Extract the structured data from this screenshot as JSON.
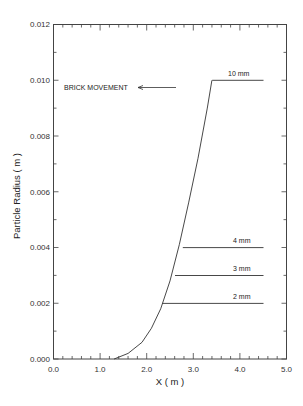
{
  "chart_data": {
    "type": "line",
    "title": "",
    "xlabel": "X ( m )",
    "ylabel": "Particle Radius ( m )",
    "xlim": [
      0.0,
      5.0
    ],
    "ylim": [
      0.0,
      0.012
    ],
    "xticks": [
      "0.0",
      "1.0",
      "2.0",
      "3.0",
      "4.0",
      "5.0"
    ],
    "yticks": [
      "0.000",
      "0.002",
      "0.004",
      "0.006",
      "0.008",
      "0.010",
      "0.012"
    ],
    "grid": false,
    "legend": null,
    "series": [
      {
        "name": "growth-curve",
        "x": [
          1.3,
          1.6,
          1.9,
          2.1,
          2.3,
          2.5,
          2.7,
          2.9,
          3.1,
          3.3,
          3.4
        ],
        "y": [
          0.0,
          0.0002,
          0.0006,
          0.0011,
          0.0018,
          0.0028,
          0.0041,
          0.0056,
          0.0072,
          0.009,
          0.01
        ]
      },
      {
        "name": "10 mm",
        "x": [
          3.4,
          4.5
        ],
        "y": [
          0.01,
          0.01
        ]
      },
      {
        "name": "4 mm",
        "x": [
          2.77,
          4.5
        ],
        "y": [
          0.004,
          0.004
        ]
      },
      {
        "name": "3 mm",
        "x": [
          2.6,
          4.5
        ],
        "y": [
          0.003,
          0.003
        ]
      },
      {
        "name": "2 mm",
        "x": [
          2.33,
          4.5
        ],
        "y": [
          0.002,
          0.002
        ]
      }
    ],
    "annotations": [
      {
        "text": "BRICK MOVEMENT",
        "arrow": "left",
        "x": 0.5,
        "y": 0.0098
      },
      {
        "text": "10 mm",
        "x": 3.85,
        "y": 0.0102
      },
      {
        "text": "4 mm",
        "x": 3.95,
        "y": 0.0042
      },
      {
        "text": "3 mm",
        "x": 3.95,
        "y": 0.0032
      },
      {
        "text": "2 mm",
        "x": 3.95,
        "y": 0.0022
      }
    ]
  },
  "labels": {
    "xlabel": "X ( m )",
    "ylabel": "Particle Radius ( m )",
    "brick": "BRICK MOVEMENT",
    "l10": "10 mm",
    "l4": "4 mm",
    "l3": "3 mm",
    "l2": "2 mm",
    "x0": "0.0",
    "x1": "1.0",
    "x2": "2.0",
    "x3": "3.0",
    "x4": "4.0",
    "x5": "5.0",
    "y0": "0.000",
    "y1": "0.002",
    "y2": "0.004",
    "y3": "0.006",
    "y4": "0.008",
    "y5": "0.010",
    "y6": "0.012"
  }
}
